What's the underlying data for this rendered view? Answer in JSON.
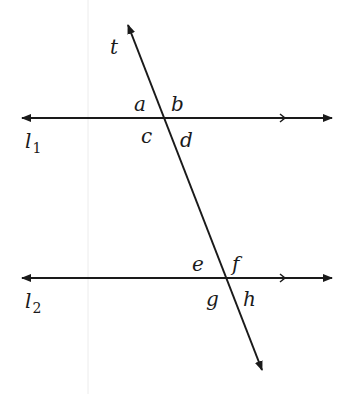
{
  "diagram": {
    "colors": {
      "line": "#1a1a1a",
      "background": "#ffffff",
      "guide": "#e6e6e6"
    },
    "transversal": {
      "name": "t",
      "from": [
        128,
        25
      ],
      "to": [
        262,
        370
      ]
    },
    "lines": [
      {
        "id": "l1",
        "name": "l",
        "subscript": "1",
        "y": 118,
        "x_from": 22,
        "x_to": 332,
        "tick_x": 283
      },
      {
        "id": "l2",
        "name": "l",
        "subscript": "2",
        "y": 278,
        "x_from": 22,
        "x_to": 332,
        "tick_x": 283
      }
    ],
    "angles": [
      {
        "label": "a",
        "x": 134,
        "y": 111
      },
      {
        "label": "b",
        "x": 171,
        "y": 111
      },
      {
        "label": "c",
        "x": 141,
        "y": 143
      },
      {
        "label": "d",
        "x": 180,
        "y": 147
      },
      {
        "label": "e",
        "x": 192,
        "y": 271
      },
      {
        "label": "f",
        "x": 232,
        "y": 271
      },
      {
        "label": "g",
        "x": 206,
        "y": 306
      },
      {
        "label": "h",
        "x": 243,
        "y": 306
      }
    ],
    "line_labels": [
      {
        "label": "t",
        "x": 110,
        "y": 54
      },
      {
        "label": "l",
        "sub": "1",
        "x": 25,
        "y": 148
      },
      {
        "label": "l",
        "sub": "2",
        "x": 25,
        "y": 308
      }
    ]
  }
}
